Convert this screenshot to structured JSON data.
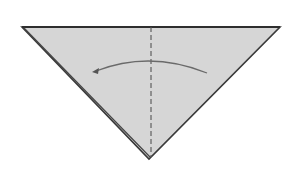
{
  "diagram": {
    "type": "origami-fold-step",
    "shape": "triangle",
    "colors": {
      "background": "#ffffff",
      "paper_fill": "#d6d6d6",
      "edge": "#3a3a3a",
      "crease": "#555555",
      "arrow": "#6a6a6a"
    },
    "triangle": {
      "points": [
        [
          22,
          27
        ],
        [
          280,
          27
        ],
        [
          149,
          159
        ]
      ]
    },
    "crease": {
      "style": "valley-fold-dashed",
      "from": [
        151,
        27
      ],
      "to": [
        151,
        157
      ]
    },
    "arrow": {
      "direction": "right-to-left",
      "start": [
        207,
        73
      ],
      "control": [
        150,
        50
      ],
      "end": [
        93,
        72
      ]
    }
  }
}
